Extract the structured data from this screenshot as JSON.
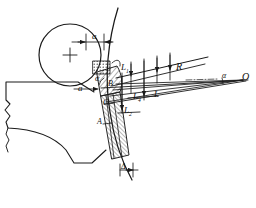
{
  "figure": {
    "kind": "engineering-drawing",
    "line_color": "#1a1a1a",
    "hatch_color": "#1a1a1a",
    "background": "#ffffff"
  },
  "labels": {
    "gap_top": "a",
    "gap_lower": "a",
    "angle_left": "α",
    "angle_right": "α",
    "radius": "R",
    "length_main": "L",
    "length_1": "L",
    "length_1_sub": "1",
    "length_2": "L",
    "length_2_sub": "2",
    "length_4": "L",
    "length_4_sub": "4",
    "delta": "Δ",
    "point_a": "A",
    "point_b": "B",
    "point_c": "C",
    "centre_o": "O"
  },
  "annotations": {
    "circle_centre_mark": "+",
    "centre_o_mark": "·"
  }
}
